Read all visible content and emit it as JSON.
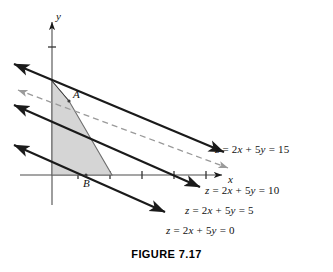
{
  "figure": {
    "caption": "FIGURE 7.17",
    "caption_y": 248
  },
  "axes": {
    "x_label": "x",
    "y_label": "y",
    "origin": {
      "x": 52,
      "y": 175
    },
    "x_ticks": [
      {
        "value": 1,
        "px": 78
      },
      {
        "value": 2,
        "px": 110
      },
      {
        "value": 3,
        "px": 142
      },
      {
        "value": 4,
        "px": 174
      },
      {
        "value": 5,
        "px": 206
      }
    ],
    "y_ticks": [
      {
        "value": 3,
        "px": 47
      }
    ],
    "x_axis_from": 20,
    "x_axis_to": 222,
    "y_axis_from": 22,
    "y_axis_to": 205
  },
  "vertices": [
    {
      "name": "A",
      "label": "A",
      "x": 69,
      "y": 101,
      "label_x": 73,
      "label_y": 88
    },
    {
      "name": "B",
      "label": "B",
      "x": 86,
      "y": 175,
      "label_x": 83,
      "label_y": 177
    }
  ],
  "region": {
    "name": "feasible-region",
    "fill": "#d3d3d3",
    "stroke": "#6e6e6e",
    "points": "52,81 69,101 112,175 86,175 52,175"
  },
  "objective_lines": [
    {
      "id": "z15",
      "label": "z = 2x + 5y = 15",
      "z": 15,
      "style": "dashed",
      "color": "#9a9a9a",
      "x1": 18,
      "y1": 90,
      "x2": 228,
      "y2": 168,
      "label_x": 215,
      "label_y": 143
    },
    {
      "id": "z10",
      "label": "z = 2x + 5y = 10",
      "z": 10,
      "style": "solid",
      "color": "#1a1a1a",
      "x1": 14,
      "y1": 64,
      "x2": 224,
      "y2": 152,
      "label_x": 205,
      "label_y": 184
    },
    {
      "id": "z5",
      "label": "z = 2x + 5y = 5",
      "z": 5,
      "style": "solid",
      "color": "#1a1a1a",
      "x1": 14,
      "y1": 105,
      "x2": 200,
      "y2": 187,
      "label_x": 185,
      "label_y": 204
    },
    {
      "id": "z0",
      "label": "z = 2x + 5y = 0",
      "z": 0,
      "style": "solid",
      "color": "#1a1a1a",
      "x1": 14,
      "y1": 145,
      "x2": 165,
      "y2": 212,
      "label_x": 166,
      "label_y": 224
    }
  ],
  "chart_data": {
    "type": "line",
    "title": "FIGURE 7.17",
    "xlabel": "x",
    "ylabel": "y",
    "grid": false,
    "legend": "none",
    "xlim": [
      -1,
      5.5
    ],
    "ylim": [
      -1.2,
      4.8
    ],
    "x_tick_labels": [
      "1",
      "2",
      "3",
      "4",
      "5"
    ],
    "y_tick_labels": [
      "3"
    ],
    "annotations": [
      {
        "text": "A",
        "x": 0.55,
        "y": 2.3
      },
      {
        "text": "B",
        "x": 1.05,
        "y": 0
      }
    ],
    "series": [
      {
        "name": "z = 2x + 5y = 0",
        "z": 0,
        "slope": -0.4,
        "intercept": 0,
        "style": "solid"
      },
      {
        "name": "z = 2x + 5y = 5",
        "z": 5,
        "slope": -0.4,
        "intercept": 1,
        "style": "solid"
      },
      {
        "name": "z = 2x + 5y = 10",
        "z": 10,
        "slope": -0.4,
        "intercept": 2,
        "style": "solid"
      },
      {
        "name": "z = 2x + 5y = 15",
        "z": 15,
        "slope": -0.4,
        "intercept": 3,
        "style": "dashed"
      }
    ],
    "feasible_region_vertices": [
      {
        "label": "",
        "x": 0,
        "y": 3.0
      },
      {
        "label": "A",
        "x": 0.55,
        "y": 2.3
      },
      {
        "label": "",
        "x": 1.9,
        "y": 0
      },
      {
        "label": "B",
        "x": 1.05,
        "y": 0
      },
      {
        "label": "",
        "x": 0,
        "y": 0
      }
    ]
  }
}
